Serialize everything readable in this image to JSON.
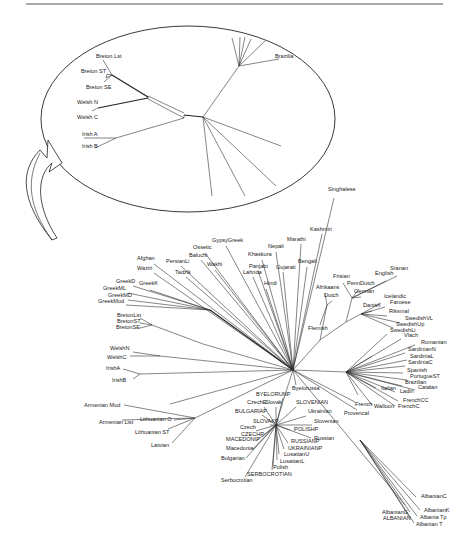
{
  "figure": {
    "type": "unrooted phylogenetic tree",
    "top_rule": true
  },
  "inset": {
    "description": "Magnified view of Celtic subtree",
    "labels": [
      {
        "text": "Breton Lst",
        "x": 96,
        "y": 58
      },
      {
        "text": "Breton ST",
        "x": 81,
        "y": 73
      },
      {
        "text": "Breton SE",
        "x": 86,
        "y": 89
      },
      {
        "text": "Welsh N",
        "x": 77,
        "y": 104
      },
      {
        "text": "Welsh C",
        "x": 77,
        "y": 119
      },
      {
        "text": "Irish A",
        "x": 82,
        "y": 136
      },
      {
        "text": "Irish B",
        "x": 82,
        "y": 148
      },
      {
        "text": "Brazilia",
        "x": 275,
        "y": 58
      }
    ]
  },
  "main_tree": {
    "root": {
      "x": 293,
      "y": 370
    },
    "labels": [
      {
        "text": "Singhalese",
        "x": 328,
        "y": 191,
        "end": [
          334,
          198
        ]
      },
      {
        "text": "Kashmiri",
        "x": 310,
        "y": 231,
        "end": [
          322,
          234
        ]
      },
      {
        "text": "Marathi",
        "x": 287,
        "y": 241,
        "end": [
          301,
          244
        ]
      },
      {
        "text": "Nepali",
        "x": 268,
        "y": 248,
        "end": [
          276,
          252
        ]
      },
      {
        "text": "Khaskura",
        "x": 248,
        "y": 256,
        "end": [
          262,
          260
        ]
      },
      {
        "text": "Bengali",
        "x": 298,
        "y": 263,
        "end": [
          307,
          267
        ]
      },
      {
        "text": "Gujarati",
        "x": 276,
        "y": 269,
        "end": [
          283,
          272
        ]
      },
      {
        "text": "Panjabi",
        "x": 249,
        "y": 268,
        "end": [
          258,
          271
        ]
      },
      {
        "text": "Lahnda",
        "x": 243,
        "y": 274,
        "end": [
          253,
          277
        ]
      },
      {
        "text": "Hindi",
        "x": 264,
        "y": 285,
        "end": [
          266,
          289
        ]
      },
      {
        "text": "GypsyGreek",
        "x": 212,
        "y": 242,
        "end": [
          226,
          246
        ]
      },
      {
        "text": "Ossetic",
        "x": 193,
        "y": 249,
        "end": [
          205,
          253
        ]
      },
      {
        "text": "Baluchi",
        "x": 189,
        "y": 257,
        "end": [
          201,
          260
        ]
      },
      {
        "text": "PersianLi",
        "x": 166,
        "y": 263,
        "end": [
          181,
          266
        ]
      },
      {
        "text": "Wakhi",
        "x": 207,
        "y": 266,
        "end": [
          215,
          270
        ]
      },
      {
        "text": "Tadzik",
        "x": 175,
        "y": 274,
        "end": [
          186,
          277
        ]
      },
      {
        "text": "Afghan",
        "x": 137,
        "y": 260,
        "end": [
          154,
          264
        ]
      },
      {
        "text": "Waziri",
        "x": 137,
        "y": 270,
        "end": [
          154,
          273
        ]
      },
      {
        "text": "GreekD",
        "x": 116,
        "y": 283,
        "end": [
          133,
          286
        ]
      },
      {
        "text": "GreekK",
        "x": 139,
        "y": 285,
        "end": [
          150,
          290
        ]
      },
      {
        "text": "GreekML",
        "x": 103,
        "y": 290,
        "end": [
          128,
          293
        ]
      },
      {
        "text": "GreekMD",
        "x": 108,
        "y": 297,
        "end": [
          128,
          300
        ]
      },
      {
        "text": "GreekMod",
        "x": 98,
        "y": 303,
        "end": [
          126,
          305
        ]
      },
      {
        "text": "BretonLst",
        "x": 117,
        "y": 317,
        "end": [
          140,
          318
        ]
      },
      {
        "text": "BretonST",
        "x": 117,
        "y": 323,
        "end": [
          140,
          323
        ]
      },
      {
        "text": "BretonSE",
        "x": 116,
        "y": 329,
        "end": [
          140,
          328
        ]
      },
      {
        "text": "WelshN",
        "x": 110,
        "y": 350,
        "end": [
          133,
          352
        ]
      },
      {
        "text": "WelshC",
        "x": 107,
        "y": 359,
        "end": [
          130,
          356
        ]
      },
      {
        "text": "IrishA",
        "x": 106,
        "y": 370,
        "end": [
          123,
          369
        ]
      },
      {
        "text": "IrishB",
        "x": 112,
        "y": 382,
        "end": [
          133,
          379
        ]
      },
      {
        "text": "Armenian Mod",
        "x": 84,
        "y": 407,
        "end": [
          124,
          405
        ]
      },
      {
        "text": "Armenian List",
        "x": 99,
        "y": 424,
        "end": [
          122,
          420
        ]
      },
      {
        "text": "Lithuanian O",
        "x": 140,
        "y": 421,
        "end": [
          174,
          420
        ]
      },
      {
        "text": "Lithuanian ST",
        "x": 135,
        "y": 434,
        "end": [
          168,
          429
        ]
      },
      {
        "text": "Latvian",
        "x": 151,
        "y": 447,
        "end": [
          172,
          443
        ]
      },
      {
        "text": "Afrikaans",
        "x": 316,
        "y": 289,
        "end": [
          325,
          294
        ]
      },
      {
        "text": "Dutch",
        "x": 324,
        "y": 297,
        "end": [
          332,
          301
        ]
      },
      {
        "text": "Flemish",
        "x": 308,
        "y": 330,
        "end": [
          320,
          325
        ]
      },
      {
        "text": "Frisian",
        "x": 333,
        "y": 278,
        "end": [
          343,
          283
        ]
      },
      {
        "text": "PennDutch",
        "x": 347,
        "y": 285,
        "end": [
          359,
          289
        ]
      },
      {
        "text": "German",
        "x": 354,
        "y": 293,
        "end": [
          361,
          297
        ]
      },
      {
        "text": "English",
        "x": 375,
        "y": 275,
        "end": [
          386,
          281
        ]
      },
      {
        "text": "Sranan",
        "x": 390,
        "y": 270,
        "end": [
          397,
          276
        ]
      },
      {
        "text": "Icelandic",
        "x": 384,
        "y": 298,
        "end": [
          381,
          303
        ]
      },
      {
        "text": "Faroese",
        "x": 390,
        "y": 304,
        "end": [
          385,
          307
        ]
      },
      {
        "text": "Danish",
        "x": 363,
        "y": 307,
        "end": [
          372,
          311
        ]
      },
      {
        "text": "Riksmal",
        "x": 389,
        "y": 313,
        "end": [
          387,
          316
        ]
      },
      {
        "text": "SwedishVL",
        "x": 405,
        "y": 320,
        "end": [
          400,
          323
        ]
      },
      {
        "text": "SwedishUp",
        "x": 396,
        "y": 326,
        "end": [
          393,
          328
        ]
      },
      {
        "text": "SwedishLi",
        "x": 390,
        "y": 332,
        "end": [
          387,
          334
        ]
      },
      {
        "text": "Vlach",
        "x": 404,
        "y": 337,
        "end": [
          401,
          339
        ]
      },
      {
        "text": "Romanian",
        "x": 421,
        "y": 344,
        "end": [
          415,
          345
        ]
      },
      {
        "text": "SardinianN",
        "x": 408,
        "y": 351,
        "end": [
          405,
          353
        ]
      },
      {
        "text": "SardiniaL",
        "x": 410,
        "y": 358,
        "end": [
          407,
          360
        ]
      },
      {
        "text": "SardiniaC",
        "x": 408,
        "y": 364,
        "end": [
          405,
          366
        ]
      },
      {
        "text": "Spanish",
        "x": 407,
        "y": 372,
        "end": [
          403,
          373
        ]
      },
      {
        "text": "PortugueST",
        "x": 410,
        "y": 378,
        "end": [
          407,
          380
        ]
      },
      {
        "text": "Brazilian",
        "x": 405,
        "y": 384,
        "end": [
          402,
          386
        ]
      },
      {
        "text": "Catalan",
        "x": 418,
        "y": 389,
        "end": [
          415,
          390
        ]
      },
      {
        "text": "Italian",
        "x": 381,
        "y": 390,
        "end": [
          376,
          388
        ]
      },
      {
        "text": "Ladin",
        "x": 400,
        "y": 393,
        "end": [
          395,
          392
        ]
      },
      {
        "text": "FrenchCC",
        "x": 403,
        "y": 402,
        "end": [
          398,
          401
        ]
      },
      {
        "text": "FrenchC",
        "x": 398,
        "y": 408,
        "end": [
          395,
          406
        ]
      },
      {
        "text": "Walloon",
        "x": 374,
        "y": 408,
        "end": [
          372,
          405
        ]
      },
      {
        "text": "French",
        "x": 355,
        "y": 406,
        "end": [
          355,
          402
        ]
      },
      {
        "text": "Provencal",
        "x": 344,
        "y": 415,
        "end": [
          357,
          410
        ]
      },
      {
        "text": "Byelorussa",
        "x": 292,
        "y": 390,
        "end": [
          296,
          385
        ]
      },
      {
        "text": "BYELORUNP",
        "x": 256,
        "y": 396,
        "end": [
          283,
          398
        ]
      },
      {
        "text": "CzechE",
        "x": 247,
        "y": 404,
        "end": [
          264,
          407
        ]
      },
      {
        "text": "Slovak",
        "x": 265,
        "y": 404,
        "end": [
          276,
          407
        ]
      },
      {
        "text": "SLOVENIAN",
        "x": 296,
        "y": 404,
        "end": [
          296,
          407
        ]
      },
      {
        "text": "BULGARIAP",
        "x": 235,
        "y": 413,
        "end": [
          262,
          415
        ]
      },
      {
        "text": "Ukrainian",
        "x": 308,
        "y": 413,
        "end": [
          306,
          416
        ]
      },
      {
        "text": "Slovenian",
        "x": 314,
        "y": 423,
        "end": [
          312,
          425
        ]
      },
      {
        "text": "SLOVAKP",
        "x": 253,
        "y": 423,
        "end": [
          270,
          425
        ]
      },
      {
        "text": "Czech",
        "x": 240,
        "y": 429,
        "end": [
          256,
          431
        ]
      },
      {
        "text": "POLISHP",
        "x": 294,
        "y": 431,
        "end": [
          290,
          430
        ]
      },
      {
        "text": "CZECHP",
        "x": 241,
        "y": 436,
        "end": [
          262,
          437
        ]
      },
      {
        "text": "MACEDONIP",
        "x": 226,
        "y": 441,
        "end": [
          256,
          441
        ]
      },
      {
        "text": "Russian",
        "x": 314,
        "y": 440,
        "end": [
          311,
          438
        ]
      },
      {
        "text": "RUSSIANP",
        "x": 291,
        "y": 443,
        "end": [
          288,
          443
        ]
      },
      {
        "text": "UKRAINIANP",
        "x": 288,
        "y": 450,
        "end": [
          284,
          449
        ]
      },
      {
        "text": "Macedonia",
        "x": 226,
        "y": 450,
        "end": [
          253,
          449
        ]
      },
      {
        "text": "LusatianU",
        "x": 284,
        "y": 456,
        "end": [
          279,
          454
        ]
      },
      {
        "text": "Bulgarian",
        "x": 221,
        "y": 460,
        "end": [
          246,
          458
        ]
      },
      {
        "text": "LusatianL",
        "x": 280,
        "y": 463,
        "end": [
          277,
          460
        ]
      },
      {
        "text": "Polish",
        "x": 273,
        "y": 469,
        "end": [
          273,
          465
        ]
      },
      {
        "text": "SERBOCROTIAN",
        "x": 247,
        "y": 476,
        "end": [
          272,
          470
        ]
      },
      {
        "text": "Serbocrotian",
        "x": 221,
        "y": 482,
        "end": [
          245,
          477
        ]
      },
      {
        "text": "AlbanianC",
        "x": 421,
        "y": 498,
        "end": [
          416,
          497
        ]
      },
      {
        "text": "AlbanianG",
        "x": 382,
        "y": 514,
        "end": [
          410,
          512
        ]
      },
      {
        "text": "AlbanianK",
        "x": 424,
        "y": 512,
        "end": [
          420,
          510
        ]
      },
      {
        "text": "ALBANIAN",
        "x": 383,
        "y": 520,
        "end": [
          410,
          518
        ]
      },
      {
        "text": "Albania Tp",
        "x": 420,
        "y": 519,
        "end": [
          417,
          516
        ]
      },
      {
        "text": "Albanian T",
        "x": 416,
        "y": 526,
        "end": [
          414,
          523
        ]
      }
    ]
  },
  "arrow": {
    "from": "main tree Celtic region",
    "to": "inset ellipse"
  }
}
